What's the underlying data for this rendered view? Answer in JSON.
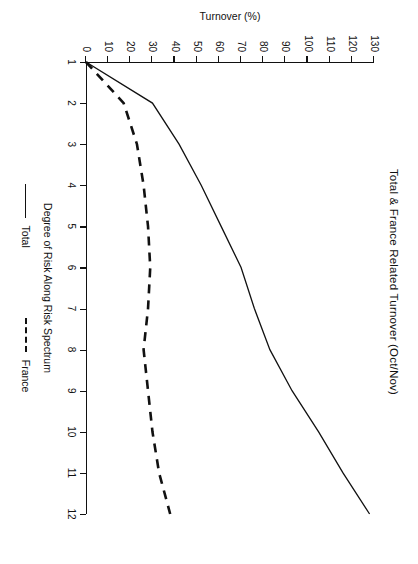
{
  "chart_data": {
    "type": "line",
    "title": "Total & France Related Turnover (Oct/Nov)",
    "xlabel": "Degree of Risk Along Risk Spectrum",
    "ylabel": "Turnover (%)",
    "x": [
      1,
      2,
      3,
      4,
      5,
      6,
      7,
      8,
      9,
      10,
      11,
      12
    ],
    "xlim": [
      1,
      12
    ],
    "ylim": [
      0,
      130
    ],
    "xticks": [
      "1",
      "2",
      "3",
      "4",
      "5",
      "6",
      "7",
      "8",
      "9",
      "10",
      "11",
      "12"
    ],
    "yticks": [
      "0",
      "10",
      "20",
      "30",
      "40",
      "50",
      "60",
      "70",
      "80",
      "90",
      "100",
      "110",
      "120",
      "130"
    ],
    "grid": false,
    "legend_position": "bottom",
    "series": [
      {
        "name": "Total",
        "style": "solid",
        "color": "#111111",
        "values": [
          0,
          30,
          42,
          52,
          61,
          70,
          76,
          83,
          93,
          105,
          116,
          128
        ]
      },
      {
        "name": "France",
        "style": "dashed",
        "color": "#111111",
        "values": [
          0,
          17,
          23,
          26,
          28,
          29,
          28,
          26,
          28,
          30,
          33,
          38
        ]
      }
    ]
  },
  "legend": {
    "total_label": "Total",
    "france_label": "France"
  }
}
